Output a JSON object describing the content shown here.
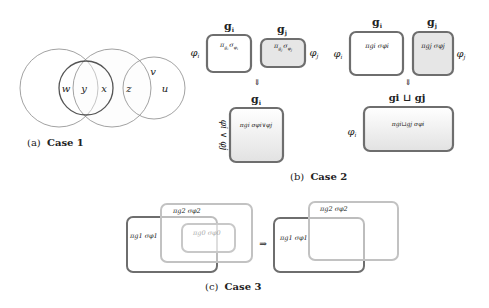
{
  "case1": {
    "caption_prefix": "(a)",
    "caption_title": "Case 1",
    "region_labels": [
      "w",
      "y",
      "x",
      "z",
      "v",
      "u"
    ]
  },
  "case2": {
    "caption_prefix": "(b)",
    "caption_title": "Case 2",
    "left": {
      "box_i_title": "g",
      "box_i_title_sub": "i",
      "box_j_title": "g",
      "box_j_title_sub": "j",
      "phi_i": "φ",
      "phi_i_sub": "i",
      "phi_j": "φ",
      "phi_j_sub": "j",
      "box_i_expr": {
        "pi": "π",
        "pi_sub": "g",
        "pi_subsub": "i",
        "sigma": "σ",
        "sigma_sub": "φ",
        "sigma_subsub": "i"
      },
      "box_j_expr": {
        "pi": "π",
        "pi_sub": "g",
        "pi_subsub": "j",
        "sigma": "σ",
        "sigma_sub": "φ",
        "sigma_subsub": "j"
      },
      "arrow": "⇓",
      "result_title": "g",
      "result_title_sub": "i",
      "result_side_label": "φi ∨ φj",
      "result_expr": "πgi σφi∨φj"
    },
    "right": {
      "box_i_title": "g",
      "box_i_title_sub": "i",
      "box_j_title": "g",
      "box_j_title_sub": "j",
      "phi_i": "φ",
      "phi_i_sub": "i",
      "phi_j": "φ",
      "phi_j_sub": "j",
      "box_i_expr": "πgi σφi",
      "box_j_expr": "πgj σφj",
      "arrow": "⇓",
      "result_title": "gi ⊔ gj",
      "result_side_label": "φ",
      "result_side_label_sub": "i",
      "result_expr": "πgi⊔gj σφi"
    }
  },
  "case3": {
    "caption_prefix": "(c)",
    "caption_title": "Case 3",
    "before": {
      "box1_expr": "πg1 σφ1",
      "box2_expr": "πg2 σφ2",
      "box0_expr": "πg0 σφ0"
    },
    "arrow": "⇒",
    "after": {
      "box1_expr": "πg1 σφ1",
      "box2_expr": "πg2 σφ2"
    }
  },
  "colors": {
    "dark_stroke": "#6e6e6e",
    "light_stroke": "#bdbdbd",
    "shaded_fill": "#e6e6e6",
    "circle_stroke": "#8a8a8a"
  }
}
